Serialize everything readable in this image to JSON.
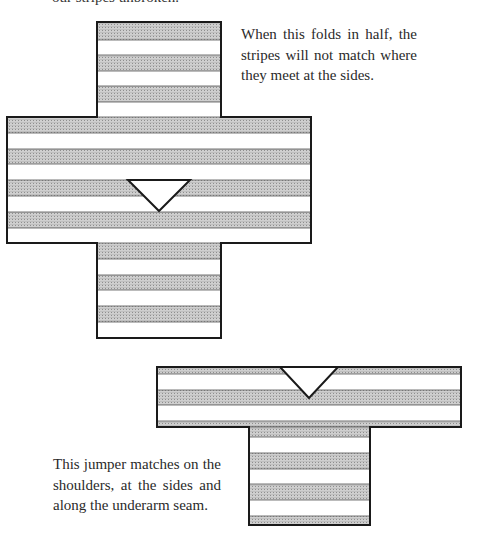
{
  "cut_off_text": "our stripes unbroken.",
  "captions": {
    "top": "When this folds in half, the stripes will not match where they meet at the sides.",
    "bottom": "This jumper matches on the shoulders, at the sides and along the underarm seam."
  },
  "colors": {
    "stripe_fill": "#c4c4c4",
    "stripe_dot": "#9a9a9a",
    "outline": "#1a1a1a",
    "background": "#ffffff"
  },
  "figures": [
    {
      "name": "unmatched-jumper-flat",
      "shape": "cross",
      "stripe_count_body": 4,
      "stripe_count_each_sleeve": 3,
      "neckline": "v-neck"
    },
    {
      "name": "matched-jumper-folded",
      "shape": "T",
      "stripes": "aligned across shoulders, sides and underarm",
      "neckline": "v-neck"
    }
  ]
}
